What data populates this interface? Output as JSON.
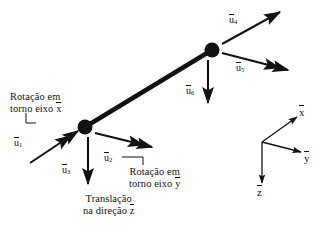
{
  "figure": {
    "type": "engineering-diagram",
    "background_color": "#ffffff",
    "ink_color": "#111111",
    "width": 326,
    "height": 231
  },
  "beam": {
    "name": "beam-element",
    "node_start": {
      "x": 85,
      "y": 127
    },
    "node_end": {
      "x": 212,
      "y": 50
    },
    "node_radius": 7.5,
    "line_width": 4.6
  },
  "vectors": [
    {
      "id": "u1",
      "label_base": "u",
      "label_sub": "1",
      "arrowhead": "double",
      "meaning": "rotation",
      "label_x": 14,
      "label_y": 137,
      "from": {
        "x": 30,
        "y": 163
      },
      "to": {
        "x": 78,
        "y": 131
      }
    },
    {
      "id": "u2",
      "label_base": "u",
      "label_sub": "2",
      "arrowhead": "double",
      "meaning": "rotation",
      "label_x": 104,
      "label_y": 152,
      "from": {
        "x": 95,
        "y": 133
      },
      "to": {
        "x": 152,
        "y": 147
      }
    },
    {
      "id": "u3",
      "label_base": "u",
      "label_sub": "3",
      "arrowhead": "single",
      "meaning": "translation",
      "label_x": 62,
      "label_y": 164,
      "from": {
        "x": 88,
        "y": 137
      },
      "to": {
        "x": 88,
        "y": 184
      }
    },
    {
      "id": "u4",
      "label_base": "u",
      "label_sub": "4",
      "arrowhead": "single",
      "meaning": "translation",
      "label_x": 229,
      "label_y": 14,
      "from": {
        "x": 222,
        "y": 44
      },
      "to": {
        "x": 280,
        "y": 12
      }
    },
    {
      "id": "u5",
      "label_base": "u",
      "label_sub": "5",
      "arrowhead": "double",
      "meaning": "rotation",
      "label_x": 236,
      "label_y": 62,
      "from": {
        "x": 222,
        "y": 53
      },
      "to": {
        "x": 288,
        "y": 70
      }
    },
    {
      "id": "u6",
      "label_base": "u",
      "label_sub": "6",
      "arrowhead": "single",
      "meaning": "translation",
      "label_x": 186,
      "label_y": 85,
      "from": {
        "x": 208,
        "y": 60
      },
      "to": {
        "x": 208,
        "y": 103
      }
    }
  ],
  "captions": {
    "rotation_x": {
      "line1": "Rotação em",
      "line2_prefix": "torno eixo ",
      "line2_axis": "x",
      "x": 10,
      "y": 91
    },
    "rotation_y": {
      "line1": "Rotação em",
      "line2_prefix": "torno eixo ",
      "line2_axis": "y",
      "x": 129,
      "y": 166
    },
    "translation_z": {
      "line1": "Translação",
      "line2_prefix": "na direção ",
      "line2_axis": "z",
      "x": 83,
      "y": 193
    }
  },
  "leaders": [
    {
      "id": "leader-rotation-x",
      "points": "26,113 26,123 36,123"
    },
    {
      "id": "leader-rotation-y",
      "points": "122,157 143,157 143,165"
    }
  ],
  "axes_triad": {
    "name": "coordinate-axes-triad",
    "origin": {
      "x": 262,
      "y": 142
    },
    "axes": [
      {
        "id": "axis-x",
        "label": "x",
        "to": {
          "x": 297,
          "y": 117
        },
        "label_x": 299,
        "label_y": 106
      },
      {
        "id": "axis-y",
        "label": "y",
        "to": {
          "x": 301,
          "y": 152
        },
        "label_x": 304,
        "label_y": 152
      },
      {
        "id": "axis-z",
        "label": "z",
        "to": {
          "x": 262,
          "y": 183
        },
        "label_x": 257,
        "label_y": 186
      }
    ],
    "line_width": 1.3
  }
}
